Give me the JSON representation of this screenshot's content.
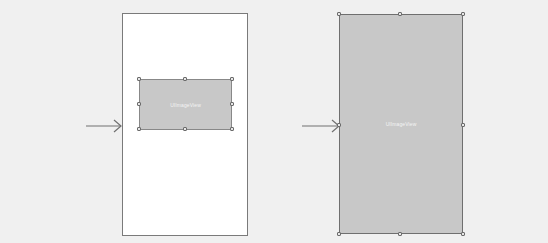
{
  "diagram": {
    "before": {
      "container": "white-screen",
      "view": {
        "label": "UIImageView",
        "fill": "#c8c8c8"
      }
    },
    "after": {
      "view": {
        "label": "UIImageView",
        "fill": "#c8c8c8"
      }
    },
    "arrows": [
      "arrow-to-before",
      "arrow-to-after"
    ],
    "colors": {
      "background": "#f0f0f0",
      "frame": "#ffffff",
      "view": "#c8c8c8",
      "stroke": "#7a7a7a"
    }
  }
}
